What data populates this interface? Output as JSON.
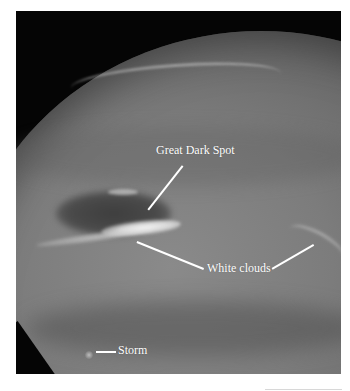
{
  "figure": {
    "background_color": "#050505",
    "planet_color": "#7c7c7c",
    "label_color": "#ffffff"
  },
  "labels": {
    "great_dark_spot": "Great Dark Spot",
    "white_clouds": "White clouds",
    "storm": "Storm"
  }
}
